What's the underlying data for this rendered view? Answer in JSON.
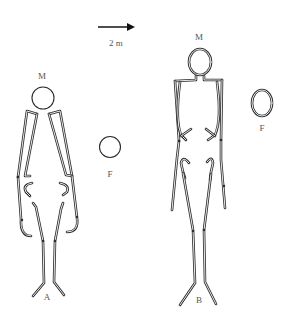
{
  "scale": {
    "label": "2 m",
    "arrow_direction": "right"
  },
  "figures": [
    {
      "id": "A",
      "label": "A",
      "head_label": "M",
      "marker_label": "F",
      "pose": "arms spread outward, legs slightly apart"
    },
    {
      "id": "B",
      "label": "B",
      "head_label": "M",
      "marker_label": "F",
      "pose": "arms along body, legs together"
    }
  ],
  "colors": {
    "line": "#2b2b2b",
    "label": "#555555",
    "background": "#ffffff"
  }
}
